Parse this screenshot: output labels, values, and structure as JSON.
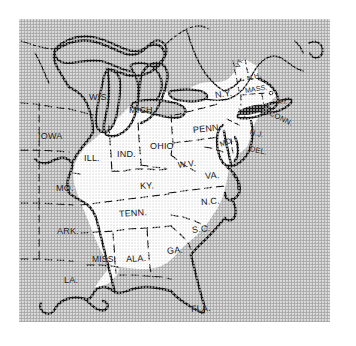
{
  "figure": {
    "background_color": "#ffffff",
    "panel_color": "#b5b5b5",
    "highlight_color": "#ffffff",
    "line_color": "#141414"
  },
  "map": {
    "region": "Eastern United States",
    "highlight_region_name": "white highlighted area",
    "border_style_state": "dashed",
    "border_style_coast": "solid",
    "state_labels": [
      {
        "abbr": "WIS.",
        "x": 70,
        "y": 73,
        "size": 9.0,
        "rotate": 0,
        "shaded": true
      },
      {
        "abbr": "MICH.",
        "x": 110,
        "y": 86,
        "size": 9.0,
        "rotate": 0,
        "shaded": true
      },
      {
        "abbr": "IOWA",
        "x": 19,
        "y": 112,
        "size": 9.0,
        "rotate": 0,
        "shaded": true
      },
      {
        "abbr": "ILL.",
        "x": 65,
        "y": 134,
        "size": 9.0,
        "rotate": 0,
        "shaded": false
      },
      {
        "abbr": "IND.",
        "x": 98,
        "y": 130,
        "size": 9.0,
        "rotate": 0,
        "shaded": false
      },
      {
        "abbr": "OHIO",
        "x": 131,
        "y": 122,
        "size": 9.0,
        "rotate": 0,
        "shaded": false
      },
      {
        "abbr": "PENN.",
        "x": 174,
        "y": 106,
        "size": 9.0,
        "rotate": -6,
        "shaded": false
      },
      {
        "abbr": "N.Y.",
        "x": 196,
        "y": 71,
        "size": 9.0,
        "rotate": -8,
        "shaded": false
      },
      {
        "abbr": "VT.",
        "x": 218,
        "y": 45,
        "size": 6.5,
        "rotate": -66,
        "shaded": false
      },
      {
        "abbr": "N.H.",
        "x": 228,
        "y": 56,
        "size": 7.0,
        "rotate": -16,
        "shaded": false
      },
      {
        "abbr": "MASS.",
        "x": 226,
        "y": 68,
        "size": 7.0,
        "rotate": -9,
        "shaded": false
      },
      {
        "abbr": "R.I.",
        "x": 259,
        "y": 80,
        "size": 5.5,
        "rotate": 0,
        "shaded": true
      },
      {
        "abbr": "CONN.",
        "x": 251,
        "y": 89,
        "size": 7.5,
        "rotate": 27,
        "shaded": true
      },
      {
        "abbr": "N.J.",
        "x": 231,
        "y": 108,
        "size": 7.5,
        "rotate": 15,
        "shaded": true
      },
      {
        "abbr": "MD.",
        "x": 201,
        "y": 121,
        "size": 7.5,
        "rotate": -22,
        "shaded": false
      },
      {
        "abbr": "DEL.",
        "x": 231,
        "y": 125,
        "size": 7.5,
        "rotate": 13,
        "shaded": true
      },
      {
        "abbr": "W.V.",
        "x": 159,
        "y": 141,
        "size": 8.5,
        "rotate": -7,
        "shaded": false
      },
      {
        "abbr": "VA.",
        "x": 186,
        "y": 152,
        "size": 9.0,
        "rotate": -4,
        "shaded": false
      },
      {
        "abbr": "MO.",
        "x": 37,
        "y": 164,
        "size": 9.0,
        "rotate": 0,
        "shaded": true
      },
      {
        "abbr": "KY.",
        "x": 121,
        "y": 162,
        "size": 9.0,
        "rotate": -3,
        "shaded": false
      },
      {
        "abbr": "TENN.",
        "x": 100,
        "y": 190,
        "size": 9.0,
        "rotate": -4,
        "shaded": false
      },
      {
        "abbr": "N.C.",
        "x": 182,
        "y": 178,
        "size": 9.0,
        "rotate": -4,
        "shaded": false
      },
      {
        "abbr": "S.C.",
        "x": 173,
        "y": 206,
        "size": 9.0,
        "rotate": -6,
        "shaded": false
      },
      {
        "abbr": "ARK.",
        "x": 38,
        "y": 207,
        "size": 9.0,
        "rotate": 0,
        "shaded": true
      },
      {
        "abbr": "MISS.",
        "x": 73,
        "y": 235,
        "size": 8.5,
        "rotate": 0,
        "shaded": false
      },
      {
        "abbr": "ALA.",
        "x": 107,
        "y": 235,
        "size": 9.0,
        "rotate": -3,
        "shaded": false
      },
      {
        "abbr": "GA.",
        "x": 148,
        "y": 227,
        "size": 9.0,
        "rotate": -5,
        "shaded": false
      },
      {
        "abbr": "LA.",
        "x": 45,
        "y": 256,
        "size": 9.0,
        "rotate": 0,
        "shaded": true
      },
      {
        "abbr": "FLA.",
        "x": 172,
        "y": 285,
        "size": 9.0,
        "rotate": -3,
        "shaded": true
      }
    ]
  }
}
